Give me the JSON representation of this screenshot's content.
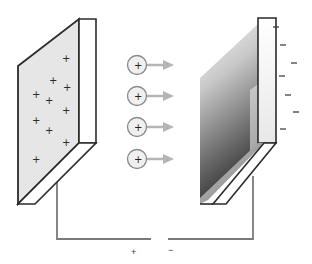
{
  "diagram": {
    "type": "parallel-plate capacitor / charge transfer illustration",
    "colors": {
      "outline": "#2b2b2b",
      "left_plate_face": "#e6e6e6",
      "left_plate_side": "#ffffff",
      "right_plate_gradient_top": "#f2f2f2",
      "right_plate_gradient_bottom": "#3c3c3c",
      "wire": "#7a7a7a",
      "arrow": "#b5b5b5",
      "ion_fill": "#f0f0f0",
      "ion_stroke": "#8a8a8a"
    },
    "left_plate": {
      "label": "positively charged plate",
      "charge_symbol": "+",
      "charges": [
        {
          "x": 65,
          "y": 59
        },
        {
          "x": 52,
          "y": 81
        },
        {
          "x": 66,
          "y": 88
        },
        {
          "x": 35,
          "y": 94
        },
        {
          "x": 48,
          "y": 100
        },
        {
          "x": 65,
          "y": 110
        },
        {
          "x": 35,
          "y": 120
        },
        {
          "x": 48,
          "y": 131
        },
        {
          "x": 65,
          "y": 143
        },
        {
          "x": 35,
          "y": 159
        }
      ]
    },
    "ions": {
      "symbol": "+",
      "count": 4,
      "items": [
        {
          "cx": 137,
          "cy": 65
        },
        {
          "cx": 137,
          "cy": 96
        },
        {
          "cx": 137,
          "cy": 127
        },
        {
          "cx": 137,
          "cy": 159
        }
      ]
    },
    "right_plate": {
      "label": "negatively charged plate",
      "charge_symbol": "−",
      "charges": [
        {
          "x": 276,
          "y": 27
        },
        {
          "x": 283,
          "y": 45
        },
        {
          "x": 294,
          "y": 63
        },
        {
          "x": 282,
          "y": 76
        },
        {
          "x": 288,
          "y": 95
        },
        {
          "x": 296,
          "y": 112
        },
        {
          "x": 283,
          "y": 129
        }
      ]
    },
    "circuit": {
      "terminal_positive": "+",
      "terminal_negative": "−"
    }
  }
}
